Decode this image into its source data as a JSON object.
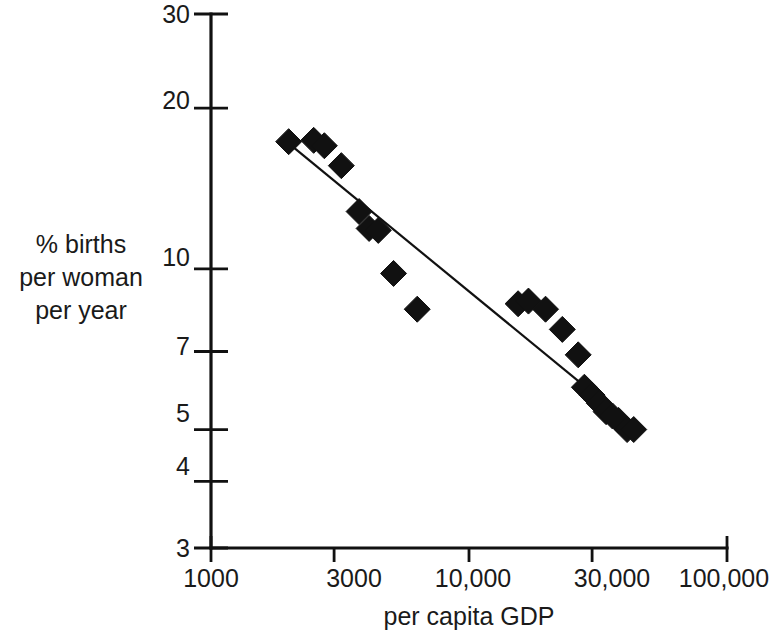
{
  "chart_data": {
    "type": "scatter",
    "title": "",
    "xlabel": "per capita GDP",
    "ylabel": "% births per woman per year",
    "ylabel_lines": [
      "% births",
      "per woman",
      "per year"
    ],
    "xscale": "log",
    "yscale": "log",
    "xlim": [
      1000,
      100000
    ],
    "ylim": [
      3,
      30
    ],
    "xticks": [
      1000,
      3000,
      10000,
      30000,
      100000
    ],
    "xtick_labels": [
      "1000",
      "3000",
      "10,000",
      "30,000",
      "100,000"
    ],
    "yticks": [
      3,
      4,
      5,
      7,
      10,
      20,
      30
    ],
    "ytick_labels": [
      "3",
      "4",
      "5",
      "7",
      "10",
      "20",
      "30"
    ],
    "grid": false,
    "legend": false,
    "marker": "diamond",
    "marker_color": "#111111",
    "axis_color": "#111111",
    "series": [
      {
        "name": "countries",
        "points": [
          {
            "x": 2000,
            "y": 17.3
          },
          {
            "x": 2500,
            "y": 17.4
          },
          {
            "x": 2750,
            "y": 17.0
          },
          {
            "x": 3200,
            "y": 15.6
          },
          {
            "x": 3750,
            "y": 12.8
          },
          {
            "x": 4100,
            "y": 11.9
          },
          {
            "x": 4450,
            "y": 11.8
          },
          {
            "x": 5100,
            "y": 9.8
          },
          {
            "x": 6300,
            "y": 8.4
          },
          {
            "x": 15500,
            "y": 8.6
          },
          {
            "x": 17000,
            "y": 8.7
          },
          {
            "x": 19800,
            "y": 8.4
          },
          {
            "x": 23000,
            "y": 7.7
          },
          {
            "x": 26500,
            "y": 6.9
          },
          {
            "x": 28000,
            "y": 6.0
          },
          {
            "x": 30000,
            "y": 5.8
          },
          {
            "x": 32000,
            "y": 5.6
          },
          {
            "x": 34000,
            "y": 5.4
          },
          {
            "x": 36000,
            "y": 5.3
          },
          {
            "x": 38000,
            "y": 5.2
          },
          {
            "x": 41000,
            "y": 5.0
          },
          {
            "x": 43500,
            "y": 5.0
          }
        ]
      }
    ],
    "trend_line": {
      "name": "regression line",
      "start": {
        "x": 2050,
        "y": 17.0
      },
      "end": {
        "x": 37000,
        "y": 5.4
      }
    }
  },
  "labels": {
    "x_axis_title": "per capita GDP",
    "y_axis_title_line1": "% births",
    "y_axis_title_line2": "per woman",
    "y_axis_title_line3": "per year",
    "ytick_30": "30",
    "ytick_20": "20",
    "ytick_10": "10",
    "ytick_7": "7",
    "ytick_5": "5",
    "ytick_4": "4",
    "ytick_3": "3",
    "xtick_1000": "1000",
    "xtick_3000": "3000",
    "xtick_10000": "10,000",
    "xtick_30000": "30,000",
    "xtick_100000": "100,000"
  }
}
